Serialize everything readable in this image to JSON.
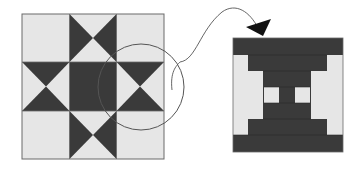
{
  "diagram": {
    "type": "quilt-block-zoom-callout",
    "colors": {
      "background": "#ffffff",
      "light_fabric": "#e6e6e6",
      "dark_fabric": "#3a3a3a",
      "outline": "#6a6a6a",
      "callout_stroke": "#555555",
      "arrowhead": "#111111"
    },
    "left_block": {
      "name": "star-quilt-block",
      "grid": "3x3",
      "center": "dark-square",
      "points": 8
    },
    "callout": {
      "shape": "circle",
      "target": "right-middle-cell"
    },
    "right_block": {
      "name": "magnified-block-detail"
    }
  }
}
